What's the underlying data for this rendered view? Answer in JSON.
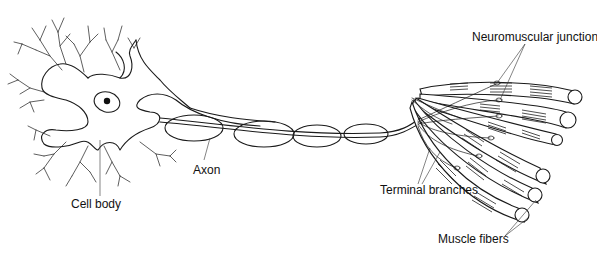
{
  "figure": {
    "labels": {
      "cell_body": "Cell body",
      "axon": "Axon",
      "neuromuscular_junction": "Neuromuscular junction",
      "terminal_branches": "Terminal branches",
      "muscle_fibers": "Muscle fibers"
    },
    "structures": {
      "myelin_segments": 4,
      "muscle_fibers": 6,
      "neuromuscular_junctions": 6
    }
  }
}
